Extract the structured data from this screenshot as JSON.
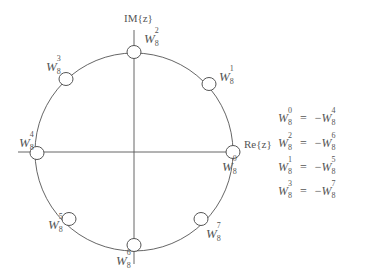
{
  "diagram": {
    "axes": {
      "imag_label": "IM{z}",
      "real_label": "Re{z}"
    },
    "unit_circle": {
      "center": [
        134,
        152
      ],
      "radius": 99
    },
    "nodes": [
      {
        "id": "w0",
        "base": "W",
        "sub": "8",
        "sup": "0",
        "angle_deg": 0
      },
      {
        "id": "w1",
        "base": "W",
        "sub": "8",
        "sup": "1",
        "angle_deg": 45
      },
      {
        "id": "w2",
        "base": "W",
        "sub": "8",
        "sup": "2",
        "angle_deg": 90
      },
      {
        "id": "w3",
        "base": "W",
        "sub": "8",
        "sup": "3",
        "angle_deg": 135
      },
      {
        "id": "w4",
        "base": "W",
        "sub": "8",
        "sup": "4",
        "angle_deg": 180
      },
      {
        "id": "w5",
        "base": "W",
        "sub": "8",
        "sup": "5",
        "angle_deg": 225
      },
      {
        "id": "w6",
        "base": "W",
        "sub": "8",
        "sup": "6",
        "angle_deg": 270
      },
      {
        "id": "w7",
        "base": "W",
        "sub": "8",
        "sup": "7",
        "angle_deg": 315
      }
    ],
    "identities": [
      {
        "lhs": {
          "base": "W",
          "sub": "8",
          "sup": "0"
        },
        "op": "=",
        "rhs_sign": "−",
        "rhs": {
          "base": "W",
          "sub": "8",
          "sup": "4"
        }
      },
      {
        "lhs": {
          "base": "W",
          "sub": "8",
          "sup": "2"
        },
        "op": "=",
        "rhs_sign": "−",
        "rhs": {
          "base": "W",
          "sub": "8",
          "sup": "6"
        }
      },
      {
        "lhs": {
          "base": "W",
          "sub": "8",
          "sup": "1"
        },
        "op": "=",
        "rhs_sign": "−",
        "rhs": {
          "base": "W",
          "sub": "8",
          "sup": "5"
        }
      },
      {
        "lhs": {
          "base": "W",
          "sub": "8",
          "sup": "3"
        },
        "op": "=",
        "rhs_sign": "−",
        "rhs": {
          "base": "W",
          "sub": "8",
          "sup": "7"
        }
      }
    ],
    "colors": {
      "stroke": "#555555",
      "node_fill": "#ffffff",
      "text": "#555555"
    }
  }
}
